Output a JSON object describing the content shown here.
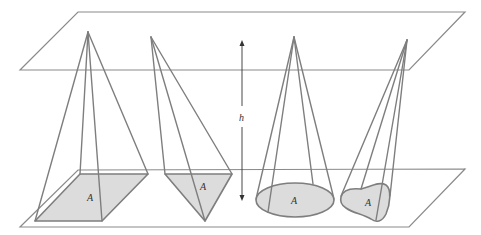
{
  "figure": {
    "colors": {
      "lines": "#7e7e7e",
      "base_fill": "#dcdcdc",
      "arrow": "#333333"
    },
    "labels": {
      "height": "h",
      "base_area_1": "A",
      "base_area_2": "A",
      "base_area_3": "A",
      "base_area_4": "A"
    },
    "solids": [
      {
        "name": "square-pyramid",
        "base_label": "A"
      },
      {
        "name": "triangular-pyramid",
        "base_label": "A"
      },
      {
        "name": "circular-cone",
        "base_label": "A"
      },
      {
        "name": "oblique-cone-irregular-base",
        "base_label": "A"
      }
    ]
  }
}
